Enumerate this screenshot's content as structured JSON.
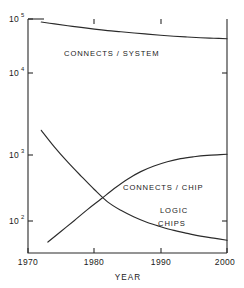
{
  "chart_data": {
    "type": "line",
    "title": "",
    "subtitle": "",
    "xlabel": "YEAR",
    "ylabel": "",
    "xlim": [
      1970,
      2000
    ],
    "ylim": [
      40,
      100000
    ],
    "yscale": "log",
    "xscale": "linear",
    "grid": false,
    "legend_position": "inline-annotations",
    "x_ticks": [
      1970,
      1980,
      1990,
      2000
    ],
    "x_tick_labels": [
      "1970",
      "1980",
      "1990",
      "2000"
    ],
    "y_ticks": [
      100,
      1000,
      10000,
      100000
    ],
    "y_tick_labels": [
      "10",
      "10",
      "10",
      "10"
    ],
    "y_tick_exponents": [
      "2",
      "3",
      "4",
      "5"
    ],
    "series": [
      {
        "name": "CONNECTS / SYSTEM",
        "label_x": 1980.5,
        "label_y": 42000,
        "x": [
          1972,
          1974,
          1976,
          1978,
          1980,
          1982,
          1984,
          1986,
          1988,
          1990,
          1992,
          1994,
          1996,
          1998,
          2000
        ],
        "values": [
          88000,
          81000,
          75000,
          70000,
          65000,
          61000,
          58000,
          55000,
          52500,
          50000,
          48000,
          46500,
          45000,
          44000,
          43000
        ]
      },
      {
        "name": "LOGIC CHIPS",
        "label_x": 1992.5,
        "label_y": 150,
        "x": [
          1972,
          1974,
          1976,
          1978,
          1980,
          1982,
          1984,
          1986,
          1988,
          1990,
          1992,
          1994,
          1996,
          1998,
          2000
        ],
        "values": [
          2000,
          1250,
          780,
          480,
          300,
          195,
          145,
          115,
          95,
          82,
          72,
          65,
          59,
          55,
          51
        ]
      },
      {
        "name": "CONNECTS / CHIP",
        "label_x": 1988.5,
        "label_y": 400,
        "x": [
          1973,
          1975,
          1977,
          1979,
          1981,
          1983,
          1985,
          1987,
          1989,
          1991,
          1993,
          1995,
          1997,
          1999,
          2000
        ],
        "values": [
          48,
          70,
          102,
          150,
          215,
          310,
          430,
          560,
          680,
          790,
          880,
          940,
          985,
          1010,
          1020
        ]
      }
    ],
    "annotations": [
      {
        "text": "CONNECTS / SYSTEM"
      },
      {
        "text": "CONNECTS / CHIP"
      },
      {
        "text": "LOGIC"
      },
      {
        "text": "CHIPS"
      }
    ],
    "colors": {
      "line": "#2b2b2b",
      "axis": "#2b2b2b",
      "text": "#1a1a1a",
      "background": "#ffffff"
    }
  },
  "labels": {
    "connects_system": "CONNECTS / SYSTEM",
    "connects_chip": "CONNECTS / CHIP",
    "logic": "LOGIC",
    "chips": "CHIPS",
    "xaxis_title": "YEAR",
    "x_1970": "1970",
    "x_1980": "1980",
    "x_1990": "1990",
    "x_2000": "2000",
    "y_base": "10",
    "y_exp_2": "2",
    "y_exp_3": "3",
    "y_exp_4": "4",
    "y_exp_5": "5"
  }
}
